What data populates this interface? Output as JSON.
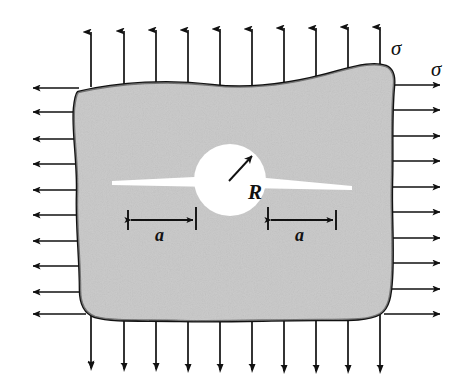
{
  "figure": {
    "type": "engineering-schematic",
    "background_color": "#ffffff",
    "plate": {
      "fill_color": "#c8c8c8",
      "outline_color": "#111111",
      "outline_width": 2.6,
      "description": "irregular wavy-edged rectangular plate"
    },
    "hole": {
      "name": "circular-hole",
      "fill_color": "#ffffff",
      "center_x": 230,
      "center_y": 180,
      "radius": 36
    },
    "crack": {
      "name": "horizontal-crack",
      "color": "#ffffff",
      "left_tip_x": 112,
      "right_tip_x": 352,
      "y": 182
    }
  },
  "labels": {
    "sigma_top": "σ",
    "sigma_right": "σ",
    "radius": "R",
    "crack_left": "a",
    "crack_right": "a"
  },
  "load_arrows": {
    "color": "#111111",
    "top": {
      "name": "tension-arrows-top",
      "count": 10,
      "direction": "up"
    },
    "bottom": {
      "name": "tension-arrows-bottom",
      "count": 10,
      "direction": "down"
    },
    "left": {
      "name": "tension-arrows-left",
      "count": 10,
      "direction": "left"
    },
    "right": {
      "name": "tension-arrows-right",
      "count": 10,
      "direction": "right"
    }
  },
  "dimensions": {
    "left": {
      "name": "dimension-a-left",
      "label": "a",
      "from_x": 128,
      "to_x": 196,
      "y": 219
    },
    "right": {
      "name": "dimension-a-right",
      "label": "a",
      "from_x": 268,
      "to_x": 336,
      "y": 219
    }
  }
}
